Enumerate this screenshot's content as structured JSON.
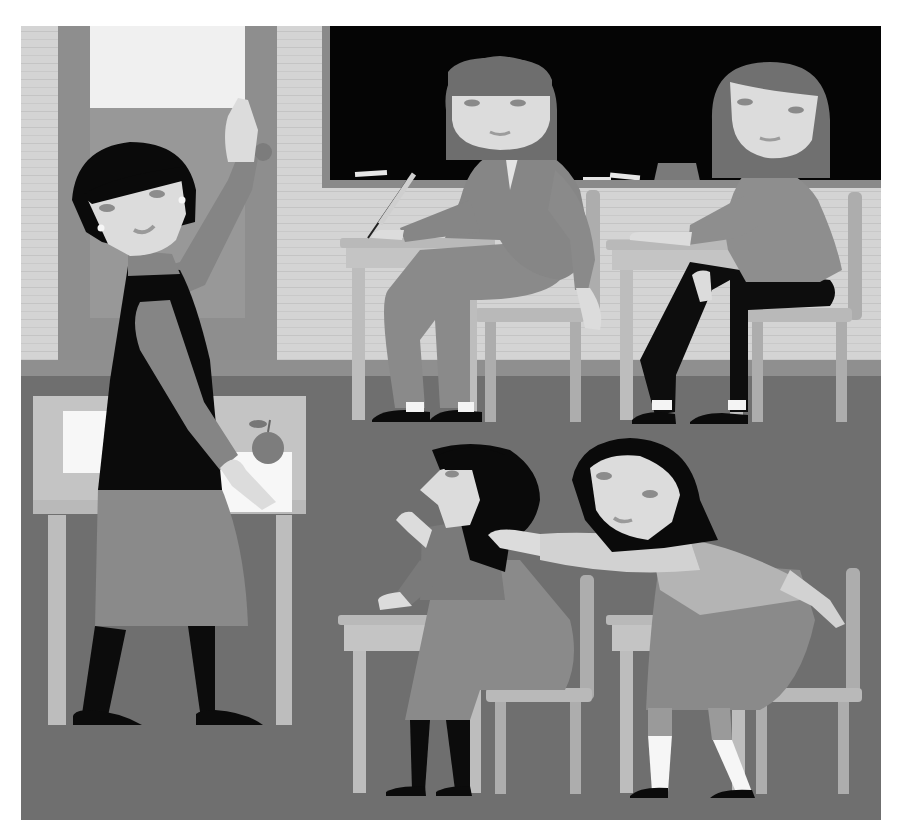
{
  "image": {
    "width": 903,
    "height": 839,
    "kind": "grayscale classroom illustration",
    "caption": "Teacher writing on door while students sit at desks; one girl leans over to tap another on the shoulder"
  },
  "palette": {
    "paper": "#ffffff",
    "wall": "#d4d4d4",
    "brick_line": "#c6c6c6",
    "door": "#8e8e8e",
    "door_panel": "#989898",
    "window": "#f0f0f0",
    "chalkboard_frame": "#8a8a8a",
    "chalkboard": "#050505",
    "chalk": "#e6e6e6",
    "eraser_top": "#7a7a7a",
    "eraser_base": "#a4a4a4",
    "baseboard": "#8f8f8f",
    "floor": "#6f6f6f",
    "floor_far": "#7b7b7b",
    "desk_top": "#b9b9b9",
    "desk_front": "#c4c4c4",
    "desk_leg": "#bdbdbd",
    "chair": "#adadad",
    "skin": "#dcdcdc",
    "skin_shadow": "#c3c3c3",
    "hair_dark": "#0a0a0a",
    "hair_mid": "#6e6e6e",
    "clothes_mid": "#7e7e7e",
    "clothes_light": "#9a9a9a",
    "clothes_dark": "#0d0d0d",
    "sock": "#f4f4f4",
    "shoe": "#0b0b0b",
    "apple": "#7d7d7d",
    "paper_sheet": "#f7f7f7"
  },
  "scene": {
    "frame": {
      "x": 21,
      "y": 26,
      "w": 860,
      "h": 794
    },
    "wall": {
      "y_bottom": 360
    },
    "baseboard": {
      "y": 360,
      "h": 16
    },
    "door": {
      "x": 58,
      "y": 26,
      "w": 219,
      "h": 334,
      "window": {
        "x": 90,
        "y": 26,
        "w": 155,
        "h": 82
      },
      "knob": {
        "cx": 263,
        "cy": 152,
        "r": 9
      }
    },
    "chalkboard": {
      "x": 322,
      "y": 26,
      "w": 559,
      "h": 162
    },
    "chalk_pieces": [
      {
        "x": 355,
        "y": 171,
        "w": 32,
        "h": 5,
        "rot": -4
      },
      {
        "x": 583,
        "y": 177,
        "w": 28,
        "h": 5,
        "rot": 0
      },
      {
        "x": 610,
        "y": 174,
        "w": 30,
        "h": 5,
        "rot": 6
      }
    ],
    "eraser": {
      "x": 656,
      "y": 163,
      "w": 42,
      "h": 18
    },
    "teacher_desk": {
      "x": 33,
      "y": 396,
      "w": 273,
      "h": 128,
      "legs": [
        {
          "x": 48,
          "y": 524,
          "w": 18,
          "h": 202
        },
        {
          "x": 276,
          "y": 524,
          "w": 16,
          "h": 202
        }
      ]
    },
    "apple": {
      "cx": 268,
      "cy": 446,
      "r": 16
    },
    "paper_sheets": [
      {
        "x": 63,
        "y": 411,
        "w": 60,
        "h": 62
      },
      {
        "x": 215,
        "y": 452,
        "w": 75,
        "h": 60
      }
    ]
  },
  "figures": [
    {
      "id": "teacher",
      "label": "Teacher",
      "hair": "dark bob",
      "outfit": "black vest, mid-gray blouse and skirt, black tights",
      "action": "reaching up to the door"
    },
    {
      "id": "student-back-left",
      "label": "Student at back-left desk",
      "hair": "mid-gray bob",
      "outfit": "gray suit",
      "action": "writing with a pen"
    },
    {
      "id": "student-back-right",
      "label": "Student at back-right desk",
      "hair": "mid-gray long hair",
      "outfit": "gray cardigan, black trousers",
      "action": "looking sideways"
    },
    {
      "id": "student-front-left",
      "label": "Student at front-left desk",
      "hair": "black bob with bangs",
      "outfit": "gray dress, black tights",
      "action": "looking up, raising hand"
    },
    {
      "id": "student-front-right",
      "label": "Student at front-right desk",
      "hair": "black with headband",
      "outfit": "light top, gray skirt, white socks",
      "action": "leaning over to tap classmate's shoulder"
    }
  ],
  "furniture": {
    "student_desks": [
      {
        "id": "desk-back-left",
        "x": 340,
        "y": 238,
        "w": 155,
        "h": 30,
        "legs": [
          {
            "x": 352,
            "y": 268,
            "h": 152
          },
          {
            "x": 464,
            "y": 268,
            "h": 152
          }
        ]
      },
      {
        "id": "desk-back-right",
        "x": 606,
        "y": 240,
        "w": 148,
        "h": 30,
        "legs": [
          {
            "x": 620,
            "y": 270,
            "h": 150
          },
          {
            "x": 730,
            "y": 270,
            "h": 150
          }
        ]
      },
      {
        "id": "desk-front-left",
        "x": 338,
        "y": 615,
        "w": 150,
        "h": 36,
        "legs": [
          {
            "x": 353,
            "y": 651,
            "h": 142
          },
          {
            "x": 468,
            "y": 651,
            "h": 142
          }
        ]
      },
      {
        "id": "desk-front-right",
        "x": 606,
        "y": 615,
        "w": 150,
        "h": 36,
        "legs": [
          {
            "x": 620,
            "y": 651,
            "h": 142
          },
          {
            "x": 732,
            "y": 651,
            "h": 142
          }
        ]
      }
    ],
    "chairs": [
      {
        "id": "chair-back-left",
        "seat": {
          "x": 475,
          "y": 308,
          "w": 110,
          "h": 14
        },
        "back": {
          "x": 586,
          "y": 190,
          "w": 14,
          "h": 128
        },
        "legs": [
          {
            "x": 485,
            "y": 322,
            "h": 100
          },
          {
            "x": 570,
            "y": 322,
            "h": 100
          }
        ]
      },
      {
        "id": "chair-back-right",
        "seat": {
          "x": 742,
          "y": 308,
          "w": 110,
          "h": 14
        },
        "back": {
          "x": 848,
          "y": 192,
          "w": 14,
          "h": 128
        },
        "legs": [
          {
            "x": 752,
            "y": 322,
            "h": 100
          },
          {
            "x": 836,
            "y": 322,
            "h": 100
          }
        ]
      },
      {
        "id": "chair-front-left",
        "seat": {
          "x": 486,
          "y": 688,
          "w": 106,
          "h": 14
        },
        "back": {
          "x": 580,
          "y": 575,
          "w": 14,
          "h": 125
        },
        "legs": [
          {
            "x": 495,
            "y": 702,
            "h": 92
          },
          {
            "x": 570,
            "y": 702,
            "h": 92
          }
        ]
      },
      {
        "id": "chair-front-right",
        "seat": {
          "x": 742,
          "y": 688,
          "w": 120,
          "h": 14
        },
        "back": {
          "x": 846,
          "y": 568,
          "w": 14,
          "h": 132
        },
        "legs": [
          {
            "x": 756,
            "y": 702,
            "h": 92
          },
          {
            "x": 838,
            "y": 702,
            "h": 92
          }
        ]
      }
    ]
  }
}
